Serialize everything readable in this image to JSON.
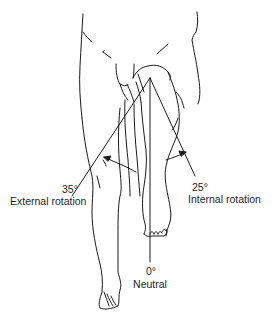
{
  "diagram": {
    "line_color": "#1a1a1a",
    "background": "#ffffff",
    "pivot": {
      "x": 150,
      "y": 78
    },
    "positions": [
      {
        "key": "external",
        "angle_label": "35°",
        "name": "External rotation",
        "angle_deg": 35
      },
      {
        "key": "neutral",
        "angle_label": "0°",
        "name": "Neutral",
        "angle_deg": 0
      },
      {
        "key": "internal",
        "angle_label": "25°",
        "name": "Internal rotation",
        "angle_deg": 25
      }
    ],
    "arrows": [
      {
        "key": "external-arrow",
        "direction": "outward (toward viewer's left)"
      },
      {
        "key": "internal-arrow",
        "direction": "inward (toward viewer's right)"
      }
    ]
  }
}
